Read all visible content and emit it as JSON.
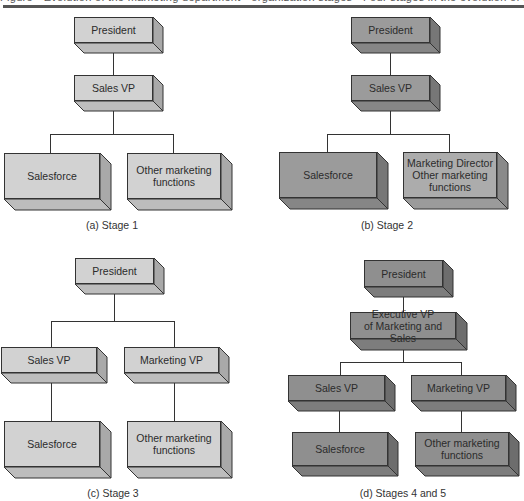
{
  "header": {
    "clipped_text": "Figure · Evolution of the marketing department · organization stages · Four stages in the evolution of the marketing group"
  },
  "palette": {
    "light": {
      "front": "#d2d2d2",
      "side": "#a9a9a9",
      "bottom": "#bdbdbd"
    },
    "medium": {
      "front": "#acacac",
      "side": "#8a8a8a",
      "bottom": "#9b9b9b"
    },
    "dark": {
      "front": "#9b9b9b",
      "side": "#777777",
      "bottom": "#868686"
    },
    "darker": {
      "front": "#8f8f8f",
      "side": "#6d6d6d",
      "bottom": "#7d7d7d"
    },
    "line": "#333333"
  },
  "diagrams": [
    {
      "id": "stage1",
      "caption": "(a) Stage 1",
      "nodes": [
        {
          "label": "President",
          "shade": "light"
        },
        {
          "label": "Sales VP",
          "shade": "light"
        },
        {
          "label": "Salesforce",
          "shade": "light"
        },
        {
          "label": "Other marketing functions",
          "shade": "light"
        }
      ]
    },
    {
      "id": "stage2",
      "caption": "(b) Stage 2",
      "nodes": [
        {
          "label": "President",
          "shade": "dark"
        },
        {
          "label": "Sales VP",
          "shade": "dark"
        },
        {
          "label": "Salesforce",
          "shade": "dark"
        },
        {
          "label": "Marketing Director Other marketing functions",
          "shade": "medium"
        }
      ]
    },
    {
      "id": "stage3",
      "caption": "(c) Stage 3",
      "nodes": [
        {
          "label": "President",
          "shade": "light"
        },
        {
          "label": "Sales VP",
          "shade": "light"
        },
        {
          "label": "Marketing VP",
          "shade": "light"
        },
        {
          "label": "Salesforce",
          "shade": "light"
        },
        {
          "label": "Other marketing functions",
          "shade": "light"
        }
      ]
    },
    {
      "id": "stage4and5",
      "caption": "(d) Stages 4 and 5",
      "nodes": [
        {
          "label": "President",
          "shade": "darker"
        },
        {
          "label": "Executive VP of Marketing and Sales",
          "shade": "darker"
        },
        {
          "label": "Sales VP",
          "shade": "darker"
        },
        {
          "label": "Marketing VP",
          "shade": "darker"
        },
        {
          "label": "Salesforce",
          "shade": "darker"
        },
        {
          "label": "Other marketing functions",
          "shade": "darker"
        }
      ]
    }
  ]
}
